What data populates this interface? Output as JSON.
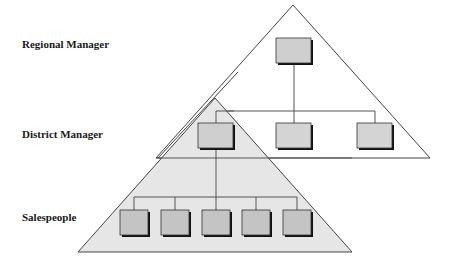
{
  "labels": {
    "regional": "Regional Manager",
    "district": "District Manager",
    "sales": "Salespeople"
  },
  "colors": {
    "triangle_fill_lower": "#e4e4e4",
    "box_fill": "#c8c8c8",
    "line": "#444444"
  },
  "levels": [
    {
      "name": "Regional Manager",
      "boxes": 1
    },
    {
      "name": "District Manager",
      "boxes": 3
    },
    {
      "name": "Salespeople",
      "boxes": 5
    }
  ]
}
